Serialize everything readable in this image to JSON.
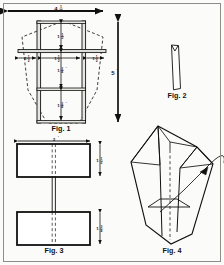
{
  "document": {
    "type": "technical-construction-diagram",
    "subject": "kite frame plans",
    "figure_count": 4
  },
  "figures": [
    {
      "id": "fig1",
      "label": "Fig. 1",
      "description": "front elevation of kite outline with cross spars"
    },
    {
      "id": "fig2",
      "label": "Fig. 2",
      "description": "notched spreader stick"
    },
    {
      "id": "fig3",
      "label": "Fig. 3",
      "description": "two rectangular sail panels joined by a strip"
    },
    {
      "id": "fig4",
      "label": "Fig. 4",
      "description": "perspective view of assembled kite"
    }
  ],
  "dimensions": {
    "overall_width": {
      "whole": "4",
      "num": "1",
      "den": "2",
      "unit": "'"
    },
    "overall_height": {
      "value": "5",
      "unit": "'"
    },
    "fig3_width": {
      "value": "3",
      "unit": "'"
    },
    "fig1_top_segment": {
      "whole": "1",
      "num": "1",
      "den": "2",
      "unit": "'"
    },
    "fig1_mid_segment": {
      "whole": "1",
      "num": "3",
      "den": "4",
      "unit": "'"
    },
    "fig1_low_segment": {
      "whole": "1",
      "num": "3",
      "den": "4",
      "unit": "'"
    },
    "fig1_span_left": {
      "whole": "1",
      "num": "1",
      "den": "2",
      "unit": "'"
    },
    "fig1_span_center": {
      "whole": "1",
      "num": "1",
      "den": "2",
      "unit": "'"
    },
    "fig1_span_right": {
      "whole": "1",
      "num": "1",
      "den": "2",
      "unit": "'"
    },
    "fig3_panel_top": {
      "whole": "1",
      "num": "1",
      "den": "2",
      "unit": "'"
    },
    "fig3_panel_bottom": {
      "whole": "1",
      "num": "3",
      "den": "4",
      "unit": "'"
    }
  },
  "colors": {
    "ink": "#111111",
    "paper": "#fbfbf9",
    "border": "#8d8d86",
    "dashed": "#2a2a2a",
    "spar_fill": "#e7e7e2"
  }
}
